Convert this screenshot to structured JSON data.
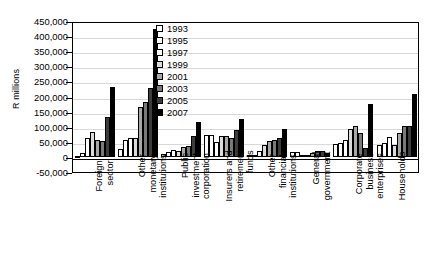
{
  "chart_data": {
    "type": "bar",
    "title": "",
    "xlabel": "",
    "ylabel": "R millions",
    "ylim": [
      -50000,
      450000
    ],
    "ytick_labels": [
      "450,000",
      "400,000",
      "350,000",
      "300,000",
      "250,000",
      "200,000",
      "150,000",
      "100,000",
      "50,000",
      "0",
      "-50,000"
    ],
    "ytick_values": [
      450000,
      400000,
      350000,
      300000,
      250000,
      200000,
      150000,
      100000,
      50000,
      0,
      -50000
    ],
    "grid": true,
    "legend_position": "top-center-inside",
    "categories": [
      "Foreign sector",
      "Other monetary institutions",
      "Public investment corporation",
      "Insurers and retirement funds",
      "Other financial institutions",
      "General government",
      "Corporate business enterprises",
      "Households"
    ],
    "category_lines": [
      [
        "Foreign",
        "sector"
      ],
      [
        "Other",
        "monetary",
        "institutions"
      ],
      [
        "Public",
        "investment",
        "corporation"
      ],
      [
        "Insurers and",
        "retirement",
        "funds"
      ],
      [
        "Other",
        "financial",
        "institutions"
      ],
      [
        "General",
        "government"
      ],
      [
        "Corporate",
        "business",
        "enterprises"
      ],
      [
        "Households"
      ]
    ],
    "series": [
      {
        "name": "1993",
        "color": "#ffffff",
        "values": [
          -4000,
          26000,
          10000,
          71000,
          6000,
          15000,
          42000,
          41000
        ]
      },
      {
        "name": "1995",
        "color": "#ffffff",
        "values": [
          13000,
          56000,
          15000,
          71000,
          7000,
          16000,
          47000,
          47000
        ]
      },
      {
        "name": "1997",
        "color": "#ffffff",
        "values": [
          64000,
          64000,
          24000,
          49000,
          20000,
          3000,
          57000,
          66000
        ]
      },
      {
        "name": "1999",
        "color": "#dcdcdc",
        "values": [
          84000,
          64000,
          21000,
          69000,
          39000,
          5000,
          94000,
          38000
        ]
      },
      {
        "name": "2001",
        "color": "#a8a8a8",
        "values": [
          55000,
          166000,
          33000,
          70000,
          52000,
          12000,
          102000,
          79000
        ]
      },
      {
        "name": "2003",
        "color": "#7a7a7a",
        "values": [
          52000,
          183000,
          35000,
          62000,
          55000,
          20000,
          78000,
          103000
        ]
      },
      {
        "name": "2005",
        "color": "#3c3c3c",
        "values": [
          131000,
          227000,
          68000,
          90000,
          63000,
          21000,
          30000,
          103000
        ]
      },
      {
        "name": "2007",
        "color": "#000000",
        "values": [
          230000,
          425000,
          114000,
          127000,
          93000,
          12000,
          176000,
          209000
        ]
      }
    ]
  },
  "axis": {
    "y_title": "R millions"
  }
}
